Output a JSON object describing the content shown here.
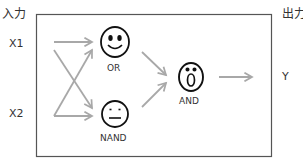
{
  "labels": {
    "input_header": "入力",
    "output_header": "出力",
    "x1": "X1",
    "x2": "X2",
    "y": "Y"
  },
  "gates": [
    {
      "id": "or",
      "label": "OR",
      "face": "smile-face-icon"
    },
    {
      "id": "nand",
      "label": "NAND",
      "face": "neutral-face-icon"
    },
    {
      "id": "and",
      "label": "AND",
      "face": "surprised-face-icon"
    }
  ],
  "colors": {
    "arrow": "#a8a8a8",
    "box_border": "#555555",
    "face_stroke": "#111111"
  }
}
